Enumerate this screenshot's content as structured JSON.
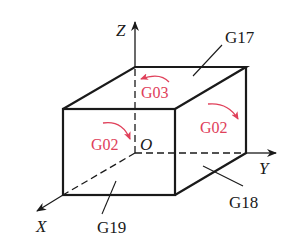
{
  "diagram": {
    "type": "coordinate-plane-selection",
    "axes": {
      "x_label": "X",
      "y_label": "Y",
      "z_label": "Z",
      "origin_label": "O"
    },
    "planes": [
      {
        "code": "G17",
        "plane": "XY",
        "face": "top"
      },
      {
        "code": "G18",
        "plane": "ZX",
        "face": "right"
      },
      {
        "code": "G19",
        "plane": "YZ",
        "face": "front"
      }
    ],
    "arc_labels": [
      {
        "text": "G03",
        "face": "top",
        "direction": "counterclockwise"
      },
      {
        "text": "G02",
        "face": "front",
        "direction": "clockwise"
      },
      {
        "text": "G02",
        "face": "right",
        "direction": "clockwise"
      }
    ],
    "colors": {
      "line": "#1a1a1a",
      "arc": "#e0405a",
      "background": "#ffffff"
    }
  }
}
